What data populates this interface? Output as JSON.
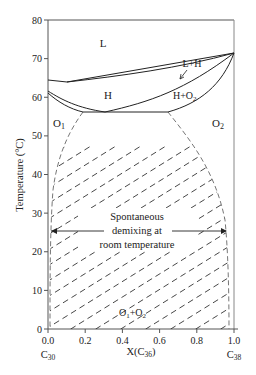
{
  "chart_data": {
    "type": "line",
    "title": "",
    "xlabel": "X(C36)",
    "ylabel": "Temperature (°C)",
    "xlim": [
      0.0,
      1.0
    ],
    "ylim": [
      0,
      80
    ],
    "x_ticks": [
      "0.0",
      "0.2",
      "0.4",
      "0.6",
      "0.8",
      "1.0"
    ],
    "y_ticks": [
      "0",
      "10",
      "20",
      "30",
      "40",
      "50",
      "60",
      "70",
      "80"
    ],
    "x_end_labels": {
      "left": "C30",
      "right": "C38"
    },
    "grid": false,
    "region_labels": [
      {
        "label": "L",
        "x": 0.3,
        "y": 74
      },
      {
        "label": "L+H",
        "x": 0.77,
        "y": 69
      },
      {
        "label": "H",
        "x": 0.3,
        "y": 59.5
      },
      {
        "label": "H+O2",
        "x": 0.73,
        "y": 59.5
      },
      {
        "label": "O1",
        "x": 0.06,
        "y": 54
      },
      {
        "label": "O2",
        "x": 0.9,
        "y": 54
      },
      {
        "label": "O1+O2",
        "x": 0.5,
        "y": 4
      }
    ],
    "series": [
      {
        "name": "liquidus",
        "style": "solid",
        "x": [
          0.0,
          0.1,
          1.0
        ],
        "y": [
          64.5,
          63.8,
          71.5
        ]
      },
      {
        "name": "solidus (L+H lower)",
        "style": "solid",
        "x": [
          0.1,
          0.5,
          1.0
        ],
        "y": [
          63.8,
          66.2,
          71.5
        ]
      },
      {
        "name": "H/O1 boundary upper",
        "style": "solid",
        "x": [
          0.0,
          0.1,
          0.2,
          0.3
        ],
        "y": [
          61.5,
          58.6,
          56.6,
          56.0
        ]
      },
      {
        "name": "H/O1 boundary lower",
        "style": "solid",
        "x": [
          0.0,
          0.1,
          0.19
        ],
        "y": [
          61.2,
          58.0,
          56.0
        ]
      },
      {
        "name": "eutectoid line",
        "style": "solid",
        "x": [
          0.19,
          0.64
        ],
        "y": [
          56.0,
          56.0
        ]
      },
      {
        "name": "H/H+O2 boundary",
        "style": "solid",
        "x": [
          0.3,
          0.6,
          0.85,
          1.0
        ],
        "y": [
          56.0,
          60.0,
          65.5,
          71.5
        ]
      },
      {
        "name": "H+O2/O2 boundary",
        "style": "solid",
        "x": [
          0.64,
          0.85,
          0.95,
          1.0
        ],
        "y": [
          56.0,
          59.5,
          64.5,
          71.5
        ]
      },
      {
        "name": "O1 solvus",
        "style": "dashed",
        "x": [
          0.19,
          0.1,
          0.05,
          0.02,
          0.01,
          0.01
        ],
        "y": [
          56.0,
          48.0,
          40.0,
          25.0,
          10.0,
          0.0
        ]
      },
      {
        "name": "O2 solvus",
        "style": "dashed",
        "x": [
          0.64,
          0.8,
          0.92,
          0.97,
          0.975,
          0.975
        ],
        "y": [
          56.0,
          48.0,
          38.0,
          25.0,
          10.0,
          0.0
        ]
      }
    ],
    "annotations": [
      {
        "text": [
          "Spontaneous",
          "demixing at",
          "room temperature"
        ],
        "arrow": "double",
        "x_range": [
          0.01,
          0.96
        ],
        "y": 25
      }
    ]
  }
}
